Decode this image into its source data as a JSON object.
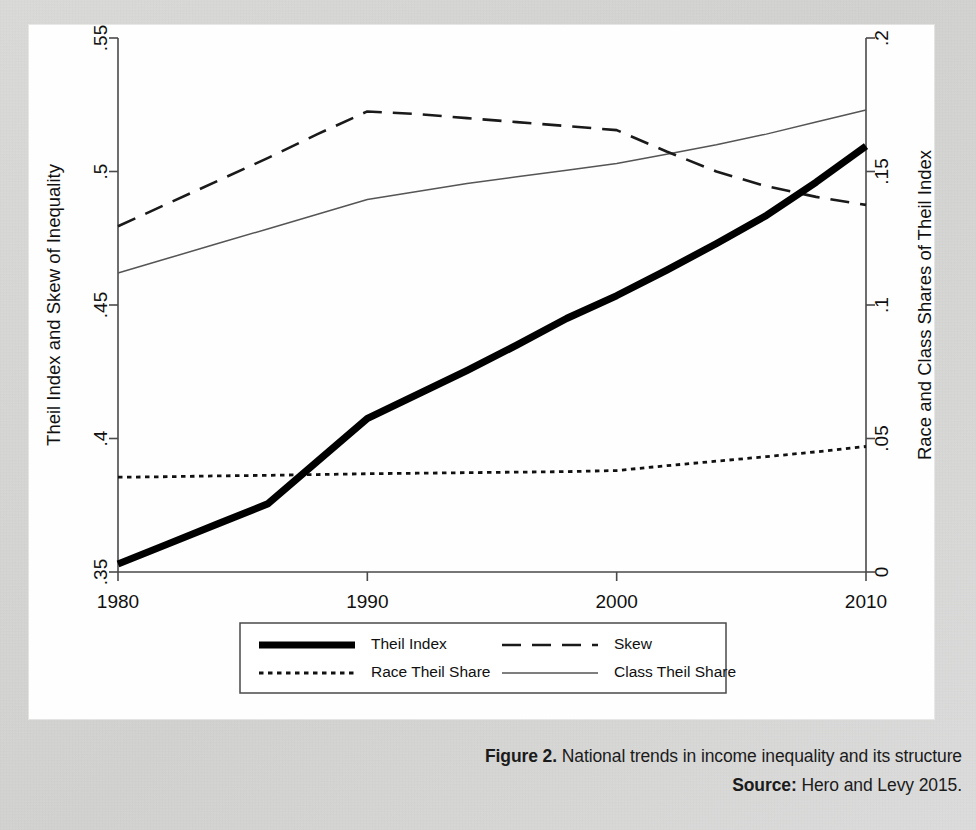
{
  "figure": {
    "caption_label": "Figure 2.",
    "caption_text": " National trends in income inequality and its structure",
    "source_label": "Source:",
    "source_text": " Hero and Levy 2015."
  },
  "axes": {
    "left_title": "Theil Index and Skew of Inequality",
    "right_title": "Race and Class Shares of Theil Index",
    "left_ticks": [
      ".35",
      ".4",
      ".45",
      ".5",
      ".55"
    ],
    "right_ticks": [
      "0",
      ".05",
      ".1",
      ".15",
      ".2"
    ],
    "x_ticks": [
      "1980",
      "1990",
      "2000",
      "2010"
    ]
  },
  "legend": {
    "items": [
      {
        "label": "Theil Index",
        "style": "thick-solid"
      },
      {
        "label": "Skew",
        "style": "long-dash"
      },
      {
        "label": "Race Theil Share",
        "style": "dotted"
      },
      {
        "label": "Class Theil Share",
        "style": "thin-solid"
      }
    ]
  },
  "chart_data": {
    "type": "line",
    "title": "National trends in income inequality and its structure",
    "xlabel": "",
    "ylabel": "Theil Index and Skew of Inequality",
    "y2label": "Race and Class Shares of Theil Index",
    "x": [
      1980,
      1982,
      1984,
      1986,
      1988,
      1990,
      1992,
      1994,
      1996,
      1998,
      2000,
      2002,
      2004,
      2006,
      2008,
      2010
    ],
    "xlim": [
      1980,
      2010
    ],
    "ylim": [
      0.35,
      0.55
    ],
    "y2lim": [
      0.0,
      0.2
    ],
    "grid": false,
    "legend_position": "below-plot",
    "series": [
      {
        "name": "Theil Index",
        "axis": "left",
        "style": "thick-solid",
        "color": "#000000",
        "values": [
          0.353,
          0.3605,
          0.368,
          0.3755,
          0.3915,
          0.4075,
          0.4165,
          0.4255,
          0.435,
          0.445,
          0.4535,
          0.463,
          0.473,
          0.4835,
          0.496,
          0.5095
        ]
      },
      {
        "name": "Skew",
        "axis": "left",
        "style": "long-dash",
        "color": "#1a1a1a",
        "values": [
          0.4795,
          0.488,
          0.4965,
          0.505,
          0.514,
          0.5225,
          0.5215,
          0.52,
          0.5185,
          0.517,
          0.5155,
          0.5075,
          0.5,
          0.4945,
          0.4905,
          0.4875
        ]
      },
      {
        "name": "Race Theil Share",
        "axis": "right",
        "style": "dotted",
        "color": "#111111",
        "values": [
          0.0355,
          0.0357,
          0.036,
          0.0362,
          0.0365,
          0.0368,
          0.037,
          0.0372,
          0.0374,
          0.0376,
          0.038,
          0.0398,
          0.0415,
          0.0432,
          0.045,
          0.047
        ]
      },
      {
        "name": "Class Theil Share",
        "axis": "right",
        "style": "thin-solid",
        "color": "#555555",
        "values": [
          0.112,
          0.1175,
          0.123,
          0.1285,
          0.134,
          0.1395,
          0.1425,
          0.1455,
          0.148,
          0.1505,
          0.153,
          0.1565,
          0.16,
          0.164,
          0.1685,
          0.173
        ]
      }
    ]
  }
}
